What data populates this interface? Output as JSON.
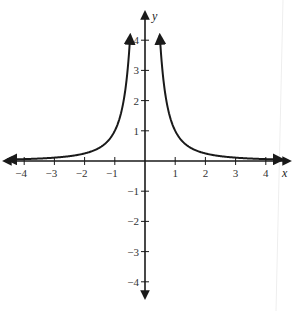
{
  "chart_data": {
    "type": "line",
    "title": "",
    "function": "y = 1/x^2",
    "xlabel": "x",
    "ylabel": "y",
    "xlim": [
      -4.5,
      4.5
    ],
    "ylim": [
      -4.5,
      4.5
    ],
    "grid": false,
    "legend": null,
    "x_ticks": [
      -4,
      -3,
      -2,
      -1,
      1,
      2,
      3,
      4
    ],
    "y_ticks": [
      -4,
      -3,
      -2,
      -1,
      1,
      2,
      3,
      4
    ],
    "x_tick_labels": [
      "−4",
      "−3",
      "−2",
      "−1",
      "1",
      "2",
      "3",
      "4"
    ],
    "y_tick_labels": [
      "−4",
      "−3",
      "−2",
      "−1",
      "1",
      "2",
      "3",
      "4"
    ],
    "series": [
      {
        "name": "left branch",
        "x": [
          -4.4,
          -4,
          -3,
          -2,
          -1.5,
          -1,
          -0.8,
          -0.6,
          -0.5
        ],
        "y": [
          0.05,
          0.0625,
          0.111,
          0.25,
          0.444,
          1,
          1.5625,
          2.778,
          4
        ]
      },
      {
        "name": "right branch",
        "x": [
          0.5,
          0.6,
          0.8,
          1,
          1.5,
          2,
          3,
          4,
          4.4
        ],
        "y": [
          4,
          2.778,
          1.5625,
          1,
          0.444,
          0.25,
          0.111,
          0.0625,
          0.05
        ]
      }
    ],
    "annotations": [
      "arrowheads at curve ends",
      "arrowheads at axis ends"
    ]
  },
  "colors": {
    "ink": "#1a1a1a",
    "background": "#ffffff"
  }
}
